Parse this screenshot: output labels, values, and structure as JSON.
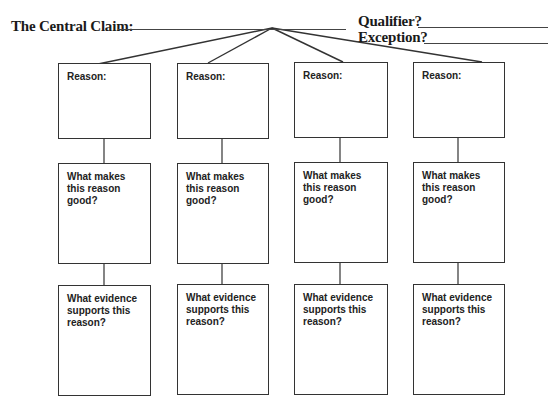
{
  "header": {
    "central_claim_label": "The Central Claim:",
    "qualifier_label": "Qualifier?",
    "exception_label": "Exception?"
  },
  "columns": [
    {
      "reason_label": "Reason:",
      "quality_label": "What makes this reason good?",
      "evidence_label": "What evidence supports this reason?"
    },
    {
      "reason_label": "Reason:",
      "quality_label": "What makes this reason good?",
      "evidence_label": "What evidence supports this reason?"
    },
    {
      "reason_label": "Reason:",
      "quality_label": "What makes this reason good?",
      "evidence_label": "What evidence supports this reason?"
    },
    {
      "reason_label": "Reason:",
      "quality_label": "What makes this reason good?",
      "evidence_label": "What evidence supports this reason?"
    }
  ]
}
